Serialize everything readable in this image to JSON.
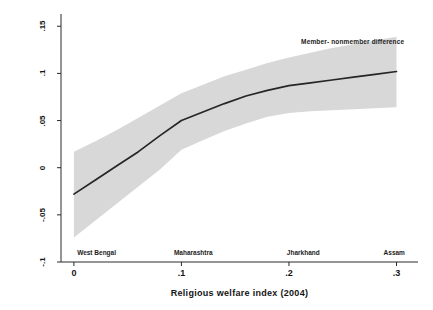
{
  "chart_data": {
    "type": "line",
    "title": "",
    "subtitle": "",
    "xlabel": "Religious  welfare index  (2004)",
    "ylabel": "Average marginal impact of membership (2004)",
    "xlim": [
      -0.012,
      0.32
    ],
    "ylim": [
      -0.1,
      0.163
    ],
    "grid": false,
    "legend_position": "inline-annotation",
    "xticks": [
      {
        "value": 0,
        "label": "0"
      },
      {
        "value": 0.1,
        "label": ".1"
      },
      {
        "value": 0.2,
        "label": ".2"
      },
      {
        "value": 0.3,
        "label": ".3"
      }
    ],
    "yticks": [
      {
        "value": -0.1,
        "label": "-.1"
      },
      {
        "value": -0.05,
        "label": "-.05"
      },
      {
        "value": 0,
        "label": "0"
      },
      {
        "value": 0.05,
        "label": ".05"
      },
      {
        "value": 0.1,
        "label": ".1"
      },
      {
        "value": 0.15,
        "label": ".15"
      }
    ],
    "annotations": [
      {
        "name": "series-label",
        "text": "Member- nonmember difference",
        "x": 0.215,
        "y": 0.132
      }
    ],
    "category_markers": [
      {
        "label": "West Bengal",
        "x": 0.003
      },
      {
        "label": "Maharashtra",
        "x": 0.093
      },
      {
        "label": "Jharkhand",
        "x": 0.198
      },
      {
        "label": "Assam",
        "x": 0.288
      }
    ],
    "series": [
      {
        "name": "Member- nonmember difference",
        "type": "line",
        "color": "#2b2b2b",
        "x": [
          0.0,
          0.02,
          0.04,
          0.06,
          0.08,
          0.1,
          0.12,
          0.14,
          0.16,
          0.18,
          0.2,
          0.22,
          0.24,
          0.26,
          0.28,
          0.3
        ],
        "values": [
          -0.028,
          -0.013,
          0.002,
          0.017,
          0.034,
          0.05,
          0.059,
          0.068,
          0.076,
          0.082,
          0.087,
          0.09,
          0.093,
          0.096,
          0.099,
          0.102
        ]
      },
      {
        "name": "95% confidence band",
        "type": "band",
        "color": "#d9d9d9",
        "x": [
          0.0,
          0.02,
          0.04,
          0.06,
          0.08,
          0.1,
          0.12,
          0.14,
          0.16,
          0.18,
          0.2,
          0.22,
          0.24,
          0.26,
          0.28,
          0.3
        ],
        "upper": [
          0.017,
          0.028,
          0.04,
          0.053,
          0.066,
          0.079,
          0.088,
          0.097,
          0.104,
          0.111,
          0.117,
          0.122,
          0.127,
          0.131,
          0.135,
          0.139
        ],
        "lower": [
          -0.074,
          -0.056,
          -0.038,
          -0.02,
          -0.002,
          0.019,
          0.029,
          0.039,
          0.047,
          0.054,
          0.058,
          0.06,
          0.061,
          0.062,
          0.063,
          0.064
        ]
      }
    ]
  },
  "geometry": {
    "plot_left": 61,
    "plot_right": 418,
    "plot_top": 14,
    "plot_bottom": 262
  }
}
